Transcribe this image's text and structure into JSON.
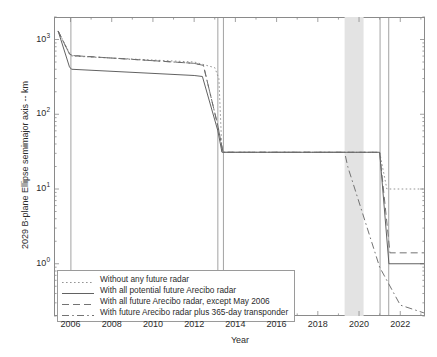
{
  "figure": {
    "width": 437,
    "height": 357,
    "background": "#ffffff"
  },
  "chart_data": {
    "type": "line",
    "title": "",
    "xlabel": "Year",
    "ylabel": "2029 B-plane Ellipse semimajor axis -- km",
    "xlim": [
      2005.2,
      2023.2
    ],
    "ylim": [
      0.2,
      2000
    ],
    "yscale": "log",
    "xscale": "linear",
    "grid": false,
    "legend_position": "lower left",
    "xticks": [
      2006,
      2008,
      2010,
      2012,
      2014,
      2016,
      2018,
      2020,
      2022
    ],
    "xticklabels": [
      "2006",
      "2008",
      "2010",
      "2012",
      "2014",
      "2016",
      "2018",
      "2020",
      "2022"
    ],
    "yticks": [
      1,
      10,
      100,
      1000
    ],
    "yticklabels": [
      "10^0",
      "10^1",
      "10^2",
      "10^3"
    ],
    "yticklabel_mantissa": [
      "10",
      "10",
      "10",
      "10"
    ],
    "yticklabel_exponent": [
      "0",
      "1",
      "2",
      "3"
    ],
    "series": [
      {
        "name": "Without any future radar",
        "style": "dotted",
        "color": "#8f8f8f",
        "x": [
          2005.4,
          2006.0,
          2006.05,
          2012.0,
          2013.0,
          2013.2,
          2013.35,
          2019.3,
          2020.6,
          2021.0,
          2021.35,
          2023.15
        ],
        "y": [
          1300,
          620,
          600,
          500,
          420,
          300,
          31,
          31,
          31,
          31,
          10,
          10
        ]
      },
      {
        "name": "With all potential future Arecibo radar",
        "style": "solid",
        "color": "#5a5a5a",
        "x": [
          2005.4,
          2005.95,
          2006.05,
          2012.0,
          2012.4,
          2013.15,
          2013.35,
          2019.3,
          2020.6,
          2021.0,
          2021.45,
          2023.15
        ],
        "y": [
          1300,
          430,
          400,
          330,
          320,
          60,
          31,
          31,
          31,
          31,
          1.0,
          1.0
        ]
      },
      {
        "name": "With all future Arecibo radar, except May 2006",
        "style": "dashed",
        "color": "#6b6b6b",
        "x": [
          2005.4,
          2005.95,
          2006.1,
          2012.0,
          2012.45,
          2013.15,
          2013.4,
          2019.3,
          2020.6,
          2021.0,
          2021.5,
          2023.15
        ],
        "y": [
          1300,
          640,
          610,
          480,
          450,
          70,
          31,
          31,
          31,
          31,
          1.4,
          1.4
        ]
      },
      {
        "name": "With future Arecibo radar plus 365-day transponder",
        "style": "dashdot",
        "color": "#6b6b6b",
        "x": [
          2005.4,
          2005.95,
          2006.1,
          2012.0,
          2012.45,
          2013.15,
          2013.4,
          2019.3,
          2019.45,
          2021.0,
          2022.0,
          2023.15
        ],
        "y": [
          1300,
          640,
          610,
          480,
          450,
          70,
          31,
          31,
          20,
          0.9,
          0.28,
          0.22
        ]
      }
    ],
    "vertical_lines": [
      {
        "x": 2006.02,
        "style": "solid"
      },
      {
        "x": 2013.15,
        "style": "solid"
      },
      {
        "x": 2013.42,
        "style": "solid"
      },
      {
        "x": 2021.02,
        "style": "solid"
      },
      {
        "x": 2021.44,
        "style": "solid"
      }
    ],
    "shaded_bands": [
      {
        "x0": 2019.3,
        "x1": 2020.22,
        "color": "#e3e3e3",
        "label": ""
      }
    ],
    "annotations": []
  },
  "legend": {
    "entries": [
      {
        "label": "Without any future radar",
        "style": "dotted"
      },
      {
        "label": "With all potential future Arecibo radar",
        "style": "solid"
      },
      {
        "label": "With all future Arecibo radar, except May 2006",
        "style": "dashed"
      },
      {
        "label": "With future Arecibo radar plus 365-day transponder",
        "style": "dashdot"
      }
    ]
  },
  "axes": {
    "x_title": "Year",
    "y_title": "2029 B-plane Ellipse semimajor axis -- km"
  }
}
